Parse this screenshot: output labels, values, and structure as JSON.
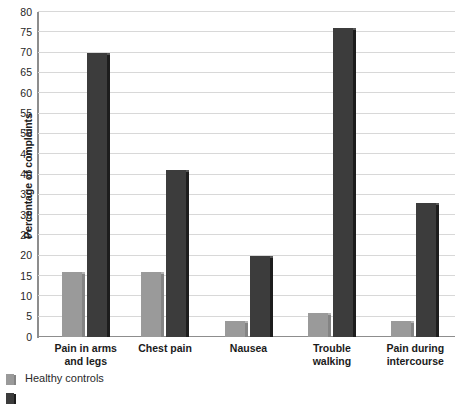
{
  "chart_data": {
    "type": "bar",
    "title": "",
    "xlabel": "",
    "ylabel": "Percentage of complaints",
    "ylim": [
      0,
      80
    ],
    "ytick_step": 5,
    "yticks": [
      "0",
      "5",
      "10",
      "15",
      "20",
      "25",
      "30",
      "35",
      "40",
      "45",
      "50",
      "55",
      "60",
      "65",
      "70",
      "75",
      "80"
    ],
    "grid": "horizontal",
    "legend_position": "bottom-left",
    "categories": [
      "Pain in arms\nand legs",
      "Chest pain",
      "Nausea",
      "Trouble\nwalking",
      "Pain during\nintercourse"
    ],
    "category_lines": [
      [
        "Pain in arms",
        "and legs"
      ],
      [
        "Chest pain",
        ""
      ],
      [
        "Nausea",
        ""
      ],
      [
        "Trouble",
        "walking"
      ],
      [
        "Pain during",
        "intercourse"
      ]
    ],
    "series": [
      {
        "name": "Healthy controls",
        "color": "#9a9a9a",
        "values": [
          16,
          16,
          4,
          6,
          4
        ]
      },
      {
        "name": "",
        "color": "#3c3c3c",
        "values": [
          70,
          41,
          20,
          76,
          33
        ]
      }
    ]
  },
  "legend": {
    "items": [
      {
        "label": "Healthy controls",
        "swatch": "light"
      },
      {
        "label": "",
        "swatch": "dark"
      }
    ]
  }
}
